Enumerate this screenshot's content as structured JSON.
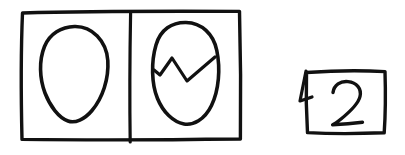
{
  "canvas": {
    "width": 405,
    "height": 155,
    "background_color": "#ffffff",
    "ink_color": "#111111",
    "style": "hand-drawn marker sketch"
  },
  "diagram": {
    "title": "Whole egg and cracked egg with number card",
    "elements_count": 3
  },
  "frame": {
    "name": "two-panel-frame",
    "label": "",
    "x": 21,
    "y": 11,
    "width": 220,
    "height": 129,
    "divider_x": 130,
    "panel_count": 2
  },
  "panels": [
    {
      "index": 1,
      "name": "panel-whole-egg",
      "label": "",
      "content": "whole egg outline",
      "egg": {
        "center_x": 74,
        "center_y": 74,
        "width": 68,
        "height": 96,
        "cracked": false
      }
    },
    {
      "index": 2,
      "name": "panel-cracked-egg",
      "label": "",
      "content": "cracked egg outline with zigzag crack",
      "egg": {
        "center_x": 186,
        "center_y": 73,
        "width": 66,
        "height": 102,
        "cracked": true
      },
      "crack": {
        "name": "zigzag-crack-line",
        "points": "154,70 160,75 172,58 187,81 215,57",
        "vertex_count": 5
      }
    }
  ],
  "card": {
    "name": "number-card",
    "value": "2",
    "x": 305,
    "y": 71,
    "width": 80,
    "height": 62,
    "has_corner_flap": true,
    "flap": {
      "name": "folded-corner-flap",
      "points": "306,71 300,101 312,97"
    }
  },
  "alt_text": {
    "frame": "Rectangular frame split into two panels",
    "panel_one": "Left panel: a whole hand-drawn egg",
    "panel_two": "Right panel: the same egg with a jagged crack across it",
    "card": "A hand-drawn card to the right showing the numeral 2"
  }
}
